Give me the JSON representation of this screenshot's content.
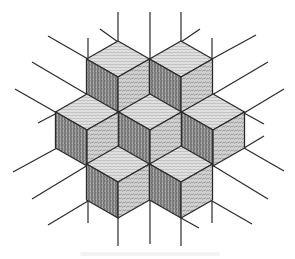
{
  "diagram": {
    "colors": {
      "background": "#ffffff",
      "line": "#2a2a2a",
      "top_face": "#d6d6d6",
      "left_face": "#8c8c8c",
      "right_face": "#b4b4b4"
    },
    "edge": {
      "dx": 31.5,
      "dy": 18,
      "vertical": 36
    },
    "cubes": [
      {
        "name": "cube-top-left",
        "near": [
          118,
          77
        ]
      },
      {
        "name": "cube-top-right",
        "near": [
          181,
          77
        ]
      },
      {
        "name": "cube-middle-left",
        "near": [
          87,
          130
        ]
      },
      {
        "name": "cube-center",
        "near": [
          150,
          130
        ]
      },
      {
        "name": "cube-middle-right",
        "near": [
          213,
          130
        ]
      },
      {
        "name": "cube-bottom-left",
        "near": [
          118,
          182
        ]
      },
      {
        "name": "cube-bottom-right",
        "near": [
          181,
          182
        ]
      }
    ],
    "grid_lines": [
      [
        118,
        12,
        118,
        42
      ],
      [
        150,
        12,
        150,
        59
      ],
      [
        181,
        12,
        181,
        42
      ],
      [
        100,
        29,
        118,
        42
      ],
      [
        181,
        42,
        200,
        29
      ],
      [
        48,
        36,
        88,
        59
      ],
      [
        88,
        38,
        88,
        59
      ],
      [
        32,
        62,
        88,
        95
      ],
      [
        15,
        89,
        57,
        113
      ],
      [
        38,
        123,
        57,
        113
      ],
      [
        212,
        38,
        212,
        59
      ],
      [
        212,
        59,
        256,
        35
      ],
      [
        212,
        95,
        268,
        62
      ],
      [
        244,
        113,
        284,
        89
      ],
      [
        244,
        113,
        264,
        124
      ],
      [
        57,
        148,
        13,
        172
      ],
      [
        88,
        165,
        32,
        199
      ],
      [
        88,
        201,
        48,
        225
      ],
      [
        88,
        201,
        88,
        223
      ],
      [
        244,
        148,
        264,
        136
      ],
      [
        244,
        148,
        284,
        171
      ],
      [
        212,
        165,
        268,
        199
      ],
      [
        212,
        201,
        252,
        224
      ],
      [
        212,
        201,
        212,
        223
      ],
      [
        118,
        218,
        118,
        246
      ],
      [
        150,
        200,
        150,
        244
      ],
      [
        181,
        218,
        181,
        246
      ],
      [
        181,
        218,
        199,
        228
      ]
    ]
  }
}
